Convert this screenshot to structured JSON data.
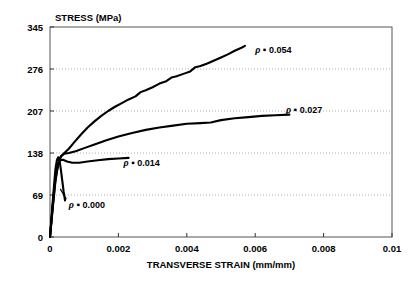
{
  "chart_data": {
    "type": "line",
    "title": "",
    "xlabel": "TRANSVERSE STRAIN (mm/mm)",
    "ylabel": "STRESS (MPa)",
    "xlim": [
      0,
      0.01
    ],
    "ylim": [
      0,
      345
    ],
    "xticks": [
      "0",
      "0.002",
      "0.004",
      "0.006",
      "0.008",
      "0.01"
    ],
    "xtick_values": [
      0,
      0.002,
      0.004,
      0.006,
      0.008,
      0.01
    ],
    "yticks": [
      "0",
      "69",
      "138",
      "207",
      "276",
      "345"
    ],
    "ytick_values": [
      0,
      69,
      138,
      207,
      276,
      345
    ],
    "grid": "horizontal-dotted",
    "legend": "inline-annotations",
    "series": [
      {
        "name": "rho-0-000",
        "label": "0.000",
        "label_prefix": "ρ ▪ ",
        "label_x": 0.00055,
        "label_y": 48,
        "leader_line": [
          [
            0.00048,
            62
          ],
          [
            0.0003,
            79
          ]
        ],
        "points": [
          [
            0.0,
            0
          ],
          [
            4e-05,
            28
          ],
          [
            8e-05,
            58
          ],
          [
            0.00012,
            86
          ],
          [
            0.00016,
            112
          ],
          [
            0.0002,
            126
          ],
          [
            0.00024,
            131
          ],
          [
            0.00028,
            125
          ],
          [
            0.00032,
            110
          ],
          [
            0.00036,
            92
          ],
          [
            0.0004,
            74
          ],
          [
            0.00044,
            60
          ]
        ]
      },
      {
        "name": "rho-0-014",
        "label": "0.014",
        "label_prefix": "ρ ▪ ",
        "label_x": 0.00215,
        "label_y": 117,
        "points": [
          [
            0.0,
            0
          ],
          [
            6e-05,
            40
          ],
          [
            0.00012,
            78
          ],
          [
            0.00018,
            106
          ],
          [
            0.00024,
            120
          ],
          [
            0.0003,
            126
          ],
          [
            0.00038,
            127
          ],
          [
            0.0005,
            124
          ],
          [
            0.00065,
            122
          ],
          [
            0.00085,
            122
          ],
          [
            0.0011,
            124
          ],
          [
            0.0014,
            126
          ],
          [
            0.0017,
            128
          ],
          [
            0.002,
            129
          ],
          [
            0.0023,
            130
          ]
        ]
      },
      {
        "name": "rho-0-027",
        "label": "0.027",
        "label_prefix": "ρ ▪ ",
        "label_x": 0.0069,
        "label_y": 203,
        "points": [
          [
            0.0,
            0
          ],
          [
            8e-05,
            50
          ],
          [
            0.00016,
            95
          ],
          [
            0.00024,
            122
          ],
          [
            0.00032,
            133
          ],
          [
            0.00042,
            137
          ],
          [
            0.00055,
            138
          ],
          [
            0.00075,
            141
          ],
          [
            0.001,
            146
          ],
          [
            0.0013,
            152
          ],
          [
            0.00165,
            159
          ],
          [
            0.002,
            165
          ],
          [
            0.0024,
            171
          ],
          [
            0.0028,
            176
          ],
          [
            0.0032,
            180
          ],
          [
            0.0036,
            183
          ],
          [
            0.004,
            186
          ],
          [
            0.0044,
            187
          ],
          [
            0.0047,
            188
          ],
          [
            0.005,
            192
          ],
          [
            0.0054,
            195
          ],
          [
            0.0058,
            197
          ],
          [
            0.0062,
            199
          ],
          [
            0.0066,
            200
          ],
          [
            0.007,
            201
          ]
        ]
      },
      {
        "name": "rho-0-054",
        "label": "0.054",
        "label_prefix": "ρ ▪ ",
        "label_x": 0.006,
        "label_y": 302,
        "points": [
          [
            0.0,
            0
          ],
          [
            8e-05,
            48
          ],
          [
            0.00016,
            92
          ],
          [
            0.00024,
            120
          ],
          [
            0.00032,
            132
          ],
          [
            0.00042,
            138
          ],
          [
            0.00055,
            145
          ],
          [
            0.0007,
            155
          ],
          [
            0.0009,
            168
          ],
          [
            0.0011,
            180
          ],
          [
            0.0013,
            190
          ],
          [
            0.0015,
            199
          ],
          [
            0.0017,
            207
          ],
          [
            0.0019,
            214
          ],
          [
            0.0021,
            220
          ],
          [
            0.0023,
            226
          ],
          [
            0.0025,
            231
          ],
          [
            0.00265,
            238
          ],
          [
            0.0028,
            241
          ],
          [
            0.003,
            246
          ],
          [
            0.0032,
            252
          ],
          [
            0.0034,
            256
          ],
          [
            0.00355,
            262
          ],
          [
            0.0037,
            264
          ],
          [
            0.0039,
            268
          ],
          [
            0.0041,
            272
          ],
          [
            0.00425,
            279
          ],
          [
            0.0044,
            281
          ],
          [
            0.0046,
            285
          ],
          [
            0.0048,
            290
          ],
          [
            0.005,
            295
          ],
          [
            0.0052,
            300
          ],
          [
            0.0054,
            306
          ],
          [
            0.0056,
            311
          ],
          [
            0.0057,
            314
          ]
        ]
      }
    ]
  }
}
